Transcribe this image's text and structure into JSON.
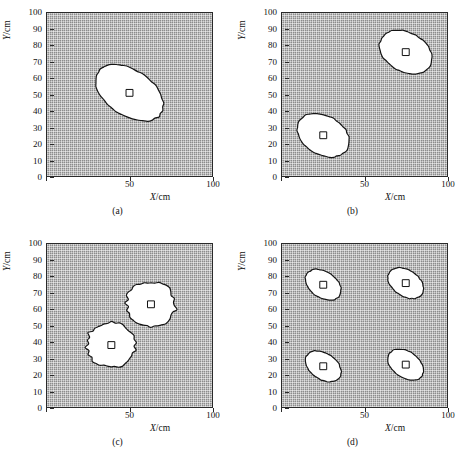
{
  "figure": {
    "panels": [
      {
        "id": "a",
        "caption": "(a)",
        "xlabel": "X/cm",
        "ylabel": "Y/cm",
        "markers": [
          {
            "x": 50,
            "y": 51
          }
        ]
      },
      {
        "id": "b",
        "caption": "(b)",
        "xlabel": "X/cm",
        "ylabel": "Y/cm",
        "markers": [
          {
            "x": 25,
            "y": 25
          },
          {
            "x": 75,
            "y": 76
          }
        ]
      },
      {
        "id": "c",
        "caption": "(c)",
        "xlabel": "X/cm",
        "ylabel": "Y/cm",
        "markers": [
          {
            "x": 39,
            "y": 38
          },
          {
            "x": 63,
            "y": 63
          }
        ]
      },
      {
        "id": "d",
        "caption": "(d)",
        "xlabel": "X/cm",
        "ylabel": "Y/cm",
        "markers": [
          {
            "x": 25,
            "y": 75
          },
          {
            "x": 75,
            "y": 76
          },
          {
            "x": 25,
            "y": 25
          },
          {
            "x": 75,
            "y": 26
          }
        ]
      }
    ]
  },
  "chart_data": {
    "type": "scatter",
    "title": "",
    "xlabel": "X/cm",
    "ylabel": "Y/cm",
    "xlim": [
      0,
      100
    ],
    "ylim": [
      0,
      100
    ],
    "grid": true,
    "legend": "none",
    "x_ticks": [
      0,
      50,
      100
    ],
    "x_tick_labels": [
      "0",
      "50",
      "100"
    ],
    "y_ticks": [
      0,
      10,
      20,
      30,
      40,
      50,
      60,
      70,
      80,
      90,
      100
    ],
    "y_tick_labels": [
      "0",
      "10",
      "20",
      "30",
      "40",
      "50",
      "60",
      "70",
      "80",
      "90",
      "100"
    ],
    "background": "cross-hatched grid mesh",
    "panels": [
      {
        "id": "a",
        "caption": "(a)",
        "regions": [
          {
            "shape": "ellipse",
            "cx": 50,
            "cy": 51,
            "rx": 23,
            "ry": 14,
            "rotation_deg": -34,
            "fill": "white",
            "marker": "open-square"
          }
        ]
      },
      {
        "id": "b",
        "caption": "(b)",
        "regions": [
          {
            "shape": "ellipse",
            "cx": 25,
            "cy": 25,
            "rx": 17,
            "ry": 12,
            "rotation_deg": -30,
            "fill": "white",
            "marker": "open-square"
          },
          {
            "shape": "ellipse",
            "cx": 75,
            "cy": 76,
            "rx": 17,
            "ry": 12,
            "rotation_deg": -30,
            "fill": "white",
            "marker": "open-square"
          }
        ]
      },
      {
        "id": "c",
        "caption": "(c)",
        "regions": [
          {
            "shape": "irregular-blob",
            "cx": 39,
            "cy": 38,
            "rx": 15,
            "ry": 14,
            "rotation_deg": -20,
            "fill": "white",
            "marker": "open-square"
          },
          {
            "shape": "irregular-blob",
            "cx": 63,
            "cy": 63,
            "rx": 15,
            "ry": 14,
            "rotation_deg": -20,
            "fill": "white",
            "marker": "open-square"
          }
        ]
      },
      {
        "id": "d",
        "caption": "(d)",
        "regions": [
          {
            "shape": "ellipse",
            "cx": 25,
            "cy": 75,
            "rx": 12,
            "ry": 8,
            "rotation_deg": -35,
            "fill": "white",
            "marker": "open-square"
          },
          {
            "shape": "ellipse",
            "cx": 75,
            "cy": 76,
            "rx": 12,
            "ry": 8,
            "rotation_deg": -35,
            "fill": "white",
            "marker": "open-square"
          },
          {
            "shape": "ellipse",
            "cx": 25,
            "cy": 25,
            "rx": 12,
            "ry": 8,
            "rotation_deg": -35,
            "fill": "white",
            "marker": "open-square"
          },
          {
            "shape": "ellipse",
            "cx": 75,
            "cy": 26,
            "rx": 12,
            "ry": 8,
            "rotation_deg": -35,
            "fill": "white",
            "marker": "open-square"
          }
        ]
      }
    ],
    "colors": {
      "background_gray": "#8c8c8c",
      "grid_light": "#ffffff",
      "grid_dark": "#282828",
      "region_fill": "#ffffff",
      "region_outline": "#141414",
      "axis": "#2a2a2a"
    }
  }
}
